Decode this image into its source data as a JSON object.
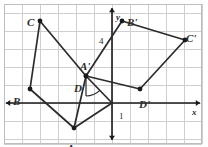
{
  "figure": {
    "kind": "coordinate-geometry-diagram",
    "canvas": {
      "width": 208,
      "height": 147
    },
    "colors": {
      "grid": "#cfcfcf",
      "border": "#bdbdbd",
      "axis": "#1a1a1a",
      "shape": "#2b2b2b",
      "vertex": "#1a1a1a",
      "background": "#ffffff"
    },
    "grid": {
      "visible": true,
      "spacing_px": 18,
      "x_lines_px": [
        4,
        22,
        40,
        58,
        76,
        94,
        112,
        130,
        148,
        166,
        184,
        202
      ],
      "y_lines_px": [
        4,
        13,
        31,
        49,
        67,
        85,
        103,
        121,
        139,
        144
      ]
    },
    "axes": {
      "origin_px": {
        "x": 112,
        "y": 103
      },
      "x_axis": {
        "label": "x",
        "label_px": {
          "x": 192,
          "y": 108
        },
        "y_px": 103,
        "x_start_px": 6,
        "x_end_px": 200,
        "arrows": "both"
      },
      "y_axis": {
        "label": "y",
        "label_px": {
          "x": 116,
          "y": 13
        },
        "x_px": 112,
        "y_start_px": 8,
        "y_end_px": 140,
        "arrows": "both"
      },
      "tick_labels": [
        {
          "text": "4",
          "px": {
            "x": 99,
            "y": 37
          },
          "axis": "y"
        },
        {
          "text": "1",
          "px": {
            "x": 119,
            "y": 112
          },
          "axis": "x"
        }
      ]
    },
    "shapes": [
      {
        "name": "quadrilateral-ABCD",
        "vertices": [
          {
            "label": "A",
            "px": {
              "x": 74,
              "y": 128
            },
            "label_px": {
              "x": 67,
              "y": 143
            }
          },
          {
            "label": "B",
            "px": {
              "x": 30,
              "y": 89
            },
            "label_px": {
              "x": 13,
              "y": 96
            }
          },
          {
            "label": "C",
            "px": {
              "x": 40,
              "y": 21
            },
            "label_px": {
              "x": 27,
              "y": 17
            }
          },
          {
            "label": "D",
            "px": {
              "x": 86,
              "y": 76
            },
            "label_px": {
              "x": 74,
              "y": 83
            }
          }
        ],
        "edges": [
          [
            "A",
            "B"
          ],
          [
            "B",
            "C"
          ],
          [
            "C",
            "D"
          ],
          [
            "D",
            "A"
          ]
        ]
      },
      {
        "name": "quadrilateral-A-prime-B-prime-C-prime-D-prime",
        "vertices": [
          {
            "label": "A'",
            "px": {
              "x": 86,
              "y": 76
            },
            "label_px": {
              "x": 80,
              "y": 61
            }
          },
          {
            "label": "B'",
            "px": {
              "x": 122,
              "y": 21
            },
            "label_px": {
              "x": 127,
              "y": 17
            }
          },
          {
            "label": "C'",
            "px": {
              "x": 185,
              "y": 40
            },
            "label_px": {
              "x": 186,
              "y": 33
            }
          },
          {
            "label": "D'",
            "px": {
              "x": 140,
              "y": 89
            },
            "label_px": {
              "x": 139,
              "y": 99
            }
          }
        ],
        "edges": [
          [
            "A'",
            "B'"
          ],
          [
            "B'",
            "C'"
          ],
          [
            "C'",
            "D'"
          ],
          [
            "D'",
            "A'"
          ]
        ]
      }
    ],
    "extra_segments": [
      {
        "name": "segment-D-to-origin",
        "from_px": {
          "x": 86,
          "y": 76
        },
        "to_px": {
          "x": 112,
          "y": 103
        }
      },
      {
        "name": "segment-origin-to-A",
        "from_px": {
          "x": 112,
          "y": 103
        },
        "to_px": {
          "x": 74,
          "y": 128
        }
      }
    ],
    "angle_mark": {
      "name": "rotation-angle-arc",
      "center_px": {
        "x": 86,
        "y": 76
      },
      "radius_px": 20,
      "from_deg": 46,
      "to_deg": 90
    }
  }
}
